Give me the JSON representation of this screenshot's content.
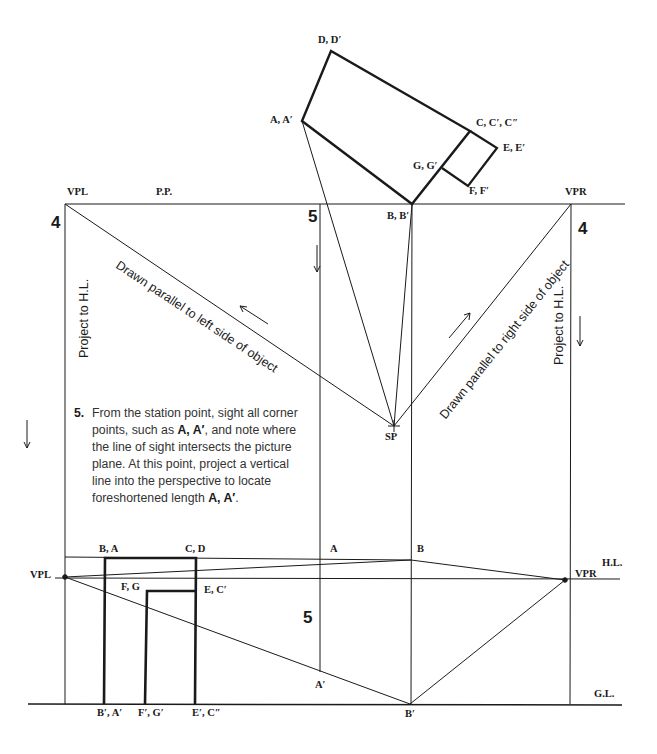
{
  "diagram": {
    "type": "two-point perspective construction",
    "plan_labels": {
      "D": "D, D′",
      "A": "A, A′",
      "C": "C, C′, C″",
      "E": "E, E′",
      "G": "G, G′",
      "F": "F, F′",
      "B": "B, B′"
    },
    "top_labels": {
      "vpl": "VPL",
      "pp": "P.P.",
      "vpr": "VPR",
      "sp": "SP"
    },
    "step_numbers": {
      "left4": "4",
      "mid5_top": "5",
      "right4": "4",
      "mid5_bottom": "5"
    },
    "rotated_text": {
      "left_diagonal": "Drawn parallel to left side of object",
      "right_diagonal": "Drawn parallel to right side of object",
      "left_project": "Project to H.L.",
      "right_project": "Project to H.L."
    },
    "note": {
      "number": "5.",
      "text_parts": [
        "From the station point, sight all corner points, such as ",
        "A, A′",
        ", and note where the line of sight intersects the picture plane. At this point, project a vertical line into the perspective to locate foreshortened length ",
        "A, A′",
        "."
      ]
    },
    "perspective_labels": {
      "ba": "B, A",
      "cd": "C, D",
      "a_top": "A",
      "b_top": "B",
      "hl": "H.L.",
      "vpl": "VPL",
      "vpr": "VPR",
      "fg": "F, G",
      "ec": "E, C′",
      "a_prime": "A′",
      "gl": "G.L.",
      "ba_prime": "B′, A′",
      "fg_prime": "F′, G′",
      "ec_prime": "E′, C″",
      "b_prime": "B′"
    }
  }
}
